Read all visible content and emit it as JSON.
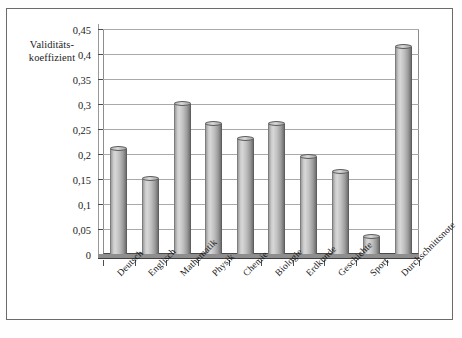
{
  "chart": {
    "type": "bar",
    "axis_title_line1": "Validitäts-",
    "axis_title_line2": "koeffizient"
  },
  "chart_data": {
    "type": "bar",
    "title": "",
    "subtitle": "",
    "xlabel": "",
    "ylabel": "Validitätskoeffizient",
    "categories": [
      "Deutsch",
      "Englisch",
      "Mathematik",
      "Physik",
      "Chemie",
      "Biologie",
      "Erdkunde",
      "Geschichte",
      "Sport",
      "Durchschnittsnote"
    ],
    "values": [
      0.21,
      0.15,
      0.3,
      0.26,
      0.23,
      0.26,
      0.195,
      0.165,
      0.035,
      0.415
    ],
    "ylim": [
      0,
      0.45
    ],
    "ytick_values": [
      0,
      0.05,
      0.1,
      0.15,
      0.2,
      0.25,
      0.3,
      0.35,
      0.4,
      0.45
    ],
    "ytick_labels": [
      "0",
      "0,05",
      "0,1",
      "0,15",
      "0,2",
      "0,25",
      "0,3",
      "0,35",
      "0,4",
      "0,45"
    ],
    "grid": true,
    "grid_axis": "y",
    "legend": false,
    "legend_position": "none",
    "series": [
      {
        "name": "Validitätskoeffizient",
        "values": [
          0.21,
          0.15,
          0.3,
          0.26,
          0.23,
          0.26,
          0.195,
          0.165,
          0.035,
          0.415
        ]
      }
    ],
    "style": "3d-cylinder",
    "bar_color": "#bfbfbf",
    "grid_color": "#a9a9a9",
    "axis_color": "#4d4d4d",
    "background_color": "#ffffff"
  }
}
